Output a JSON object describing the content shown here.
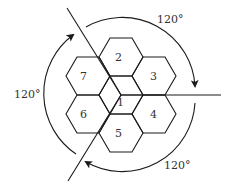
{
  "diagram": {
    "type": "hexagonal-cell-cluster-rotation",
    "cells": [
      {
        "id": "1",
        "label": "1",
        "cx": 121,
        "cy": 95
      },
      {
        "id": "2",
        "label": "2",
        "cx": 121,
        "cy": 57
      },
      {
        "id": "3",
        "label": "3",
        "cx": 154,
        "cy": 76
      },
      {
        "id": "4",
        "label": "4",
        "cx": 154,
        "cy": 114
      },
      {
        "id": "5",
        "label": "5",
        "cx": 121,
        "cy": 133
      },
      {
        "id": "6",
        "label": "6",
        "cx": 88,
        "cy": 114
      },
      {
        "id": "7",
        "label": "7",
        "cx": 88,
        "cy": 76
      }
    ],
    "angles": {
      "top_right": "120°",
      "left": "120°",
      "bottom_right": "120°"
    },
    "stroke_color": "#1a1a1a",
    "text_color": "#333333"
  }
}
